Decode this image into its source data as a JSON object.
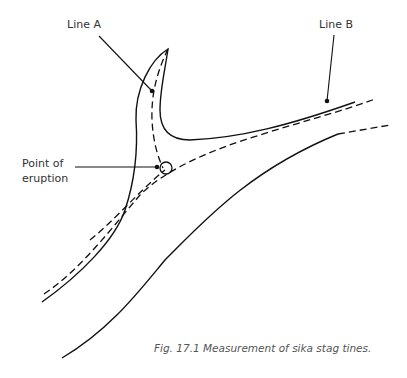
{
  "figure": {
    "labels": {
      "line_a": "Line A",
      "line_b": "Line B",
      "point_of_eruption_line1": "Point of",
      "point_of_eruption_line2": "eruption"
    },
    "caption": "Fig. 17.1 Measurement of sika stag tines."
  }
}
